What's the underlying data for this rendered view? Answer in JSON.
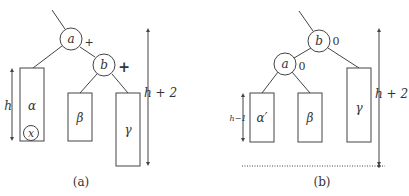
{
  "panels": [
    {
      "caption": "(a)",
      "nodes": [
        {
          "label": "a",
          "balance": "+"
        },
        {
          "label": "b",
          "balance": "+"
        }
      ],
      "subtrees": [
        {
          "label": "α",
          "inserted_node": "x"
        },
        {
          "label": "β"
        },
        {
          "label": "γ"
        }
      ],
      "height_labels": {
        "left": "h",
        "right": "h + 2"
      }
    },
    {
      "caption": "(b)",
      "nodes": [
        {
          "label": "b",
          "balance": "0"
        },
        {
          "label": "a",
          "balance": "0"
        }
      ],
      "subtrees": [
        {
          "label": "α′"
        },
        {
          "label": "β"
        },
        {
          "label": "γ"
        }
      ],
      "height_labels": {
        "left": "h−1",
        "right": "h + 2"
      }
    }
  ],
  "colors": {
    "stroke": "#444444",
    "text": "#333333",
    "background": "#ffffff"
  }
}
